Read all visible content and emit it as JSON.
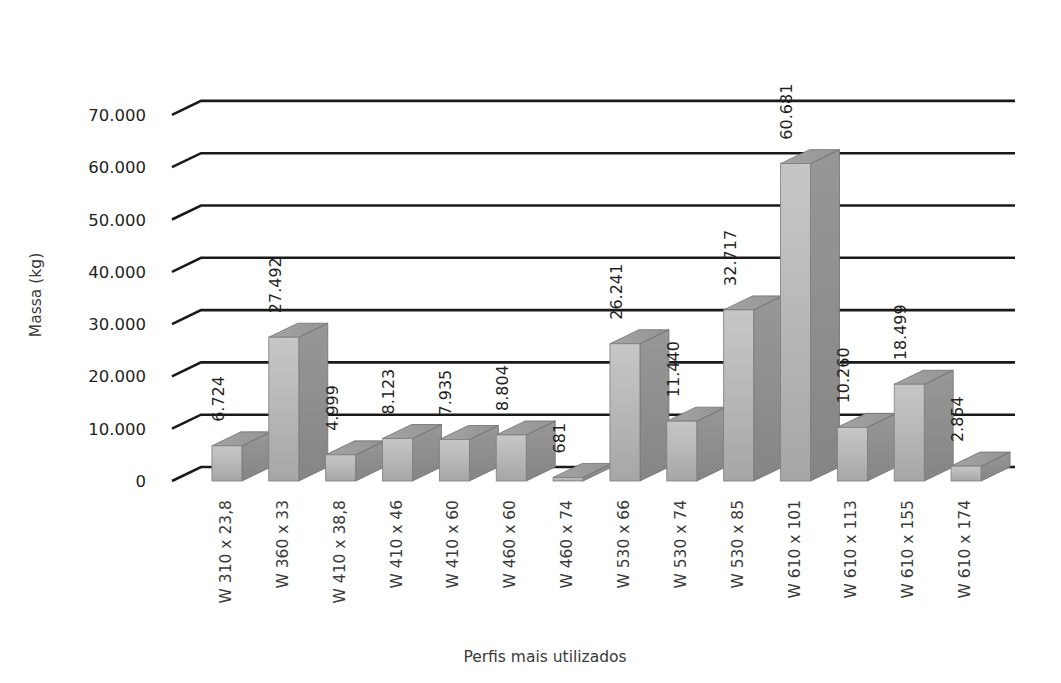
{
  "chart_data": {
    "type": "bar",
    "title": "",
    "xlabel": "Perfis mais utilizados",
    "ylabel": "Massa (kg)",
    "ylim": [
      0,
      70000
    ],
    "ytick_labels": [
      "70.000",
      "60.000",
      "50.000",
      "40.000",
      "30.000",
      "20.000",
      "10.000",
      "0"
    ],
    "ytick_values": [
      70000,
      60000,
      50000,
      40000,
      30000,
      20000,
      10000,
      0
    ],
    "grid": true,
    "legend": "none",
    "three_d": true,
    "categories": [
      "W 310 x 23,8",
      "W 360 x 33",
      "W 410 x 38,8",
      "W 410 x 46",
      "W 410 x 60",
      "W 460 x 60",
      "W 460 x 74",
      "W 530 x 66",
      "W 530 x 74",
      "W 530 x 85",
      "W 610 x 101",
      "W 610 x 113",
      "W 610 x 155",
      "W 610 x 174"
    ],
    "values": [
      6724,
      27492,
      4999,
      8123,
      7935,
      8804,
      681,
      26241,
      11440,
      32717,
      60681,
      10260,
      18499,
      2854
    ],
    "value_labels": [
      "6.724",
      "27.492",
      "4.999",
      "8.123",
      "7.935",
      "8.804",
      "681",
      "26.241",
      "11.440",
      "32.717",
      "60.681",
      "10.260",
      "18.499",
      "2.854"
    ],
    "colors": {
      "bar_front_top": "#c2c2c2",
      "bar_front_bottom": "#a9a9a9",
      "bar_top_face": "#9a9a9a",
      "bar_side_face": "#8e8e8e",
      "gridline": "#1a1a1a",
      "text": "#231f20",
      "background": "#ffffff"
    }
  }
}
